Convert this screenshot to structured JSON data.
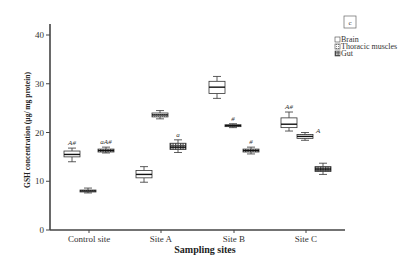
{
  "chart_data": {
    "type": "box",
    "panel_label": "c",
    "title": "",
    "xlabel": "Sampling sites",
    "ylabel": "GSH concentration (µg/ mg protein)",
    "ylim": [
      0,
      40
    ],
    "yticks": [
      0,
      10,
      20,
      30,
      40
    ],
    "grid": false,
    "legend_position": "top-right",
    "categories": [
      "Control site",
      "Site A",
      "Site B",
      "Site C"
    ],
    "series": [
      {
        "name": "Brain",
        "pattern": "plain",
        "boxes": [
          {
            "min": 14.0,
            "q1": 15.0,
            "median": 15.5,
            "q3": 16.2,
            "max": 16.8,
            "annotation": "A#"
          },
          {
            "min": 9.8,
            "q1": 10.7,
            "median": 11.4,
            "q3": 12.2,
            "max": 13.0,
            "annotation": ""
          },
          {
            "min": 27.0,
            "q1": 28.0,
            "median": 29.3,
            "q3": 30.5,
            "max": 31.5,
            "annotation": ""
          },
          {
            "min": 20.3,
            "q1": 21.0,
            "median": 21.7,
            "q3": 23.0,
            "max": 24.2,
            "annotation": "A#"
          }
        ]
      },
      {
        "name": "Thoracic muscles",
        "pattern": "dotted",
        "boxes": [
          {
            "min": 7.6,
            "q1": 7.8,
            "median": 8.0,
            "q3": 8.2,
            "max": 8.6,
            "annotation": ""
          },
          {
            "min": 22.8,
            "q1": 23.2,
            "median": 23.6,
            "q3": 24.0,
            "max": 24.5,
            "annotation": ""
          },
          {
            "min": 21.0,
            "q1": 21.2,
            "median": 21.4,
            "q3": 21.6,
            "max": 21.8,
            "annotation": "#"
          },
          {
            "min": 18.4,
            "q1": 18.8,
            "median": 19.2,
            "q3": 19.6,
            "max": 20.0,
            "annotation": "A"
          }
        ]
      },
      {
        "name": "Gut",
        "pattern": "hatched",
        "boxes": [
          {
            "min": 15.8,
            "q1": 16.0,
            "median": 16.3,
            "q3": 16.6,
            "max": 17.0,
            "annotation": "aA#"
          },
          {
            "min": 15.9,
            "q1": 16.5,
            "median": 17.0,
            "q3": 17.8,
            "max": 18.5,
            "annotation": "a"
          },
          {
            "min": 15.6,
            "q1": 16.0,
            "median": 16.3,
            "q3": 16.6,
            "max": 17.0,
            "annotation": "#"
          },
          {
            "min": 11.4,
            "q1": 12.0,
            "median": 12.5,
            "q3": 13.0,
            "max": 13.7,
            "annotation": ""
          }
        ]
      }
    ]
  },
  "legend": {
    "items": [
      "Brain",
      "Thoracic muscles",
      "Gut"
    ]
  }
}
